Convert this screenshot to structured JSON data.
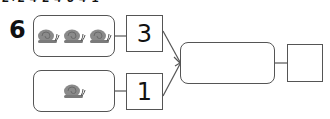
{
  "header": {
    "cut_off_text": "2+2  4-2  4-3  4-1"
  },
  "question": {
    "number": "6",
    "top_group": {
      "icon": "snail-icon",
      "count": 3,
      "value": "3"
    },
    "bottom_group": {
      "icon": "snail-icon",
      "count": 1,
      "value": "1"
    },
    "result_box": {
      "value": ""
    },
    "answer_box": {
      "value": ""
    }
  },
  "colors": {
    "border": "#555555",
    "snail": "#8a8a8a",
    "text": "#111111",
    "background": "#ffffff"
  }
}
